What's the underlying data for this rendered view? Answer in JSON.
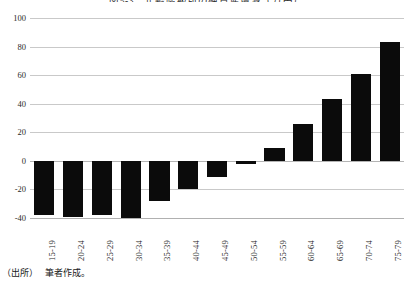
{
  "figure": {
    "title": "図5-3　年齢階級別の純資産増減（万円）",
    "source_label": "（出所）",
    "source_text": "筆者作成。"
  },
  "chart_data": {
    "type": "bar",
    "title": "図5-3　年齢階級別の純資産増減（万円）",
    "xlabel": "",
    "ylabel": "",
    "categories": [
      "15-19",
      "20-24",
      "25-29",
      "30-34",
      "35-39",
      "40-44",
      "45-49",
      "50-54",
      "55-59",
      "60-64",
      "65-69",
      "70-74",
      "75-79"
    ],
    "values": [
      -38,
      -39,
      -38,
      -40,
      -28,
      -20,
      -11,
      -2,
      9,
      26,
      43,
      61,
      83
    ],
    "ylim": [
      -40,
      100
    ],
    "yticks": [
      100,
      80,
      60,
      40,
      20,
      0,
      -20,
      -40
    ],
    "ytick_labels": [
      "100",
      "80",
      "60",
      "40",
      "20",
      "0",
      "-20",
      "-40"
    ],
    "grid": true,
    "legend": false,
    "bar_color": "#0b0b0b",
    "gridline_color": "#c9c9c9"
  }
}
